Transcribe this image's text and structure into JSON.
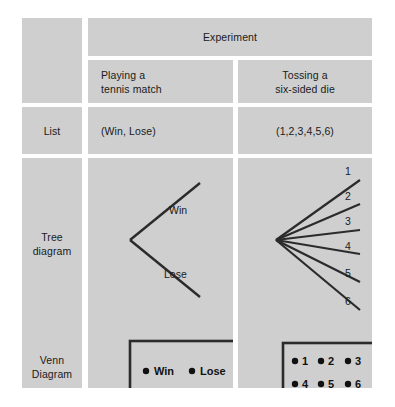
{
  "table": {
    "experiment_header": "Experiment",
    "columns": [
      {
        "id": "playing-tennis",
        "title_line1": "Playing a",
        "title_line2": "tennis match"
      },
      {
        "id": "tossing-die",
        "title_line1": "Tossing a",
        "title_line2": "six-sided die"
      }
    ],
    "row_labels": {
      "list": "List",
      "tree_line1": "Tree",
      "tree_line2": "diagram",
      "venn_line1": "Venn",
      "venn_line2": "Diagram"
    },
    "list_row": {
      "tennis": "(Win, Lose)",
      "die": "(1,2,3,4,5,6)"
    },
    "tree_row": {
      "tennis_branches": [
        "Win",
        "Lose"
      ],
      "die_branches": [
        "1",
        "2",
        "3",
        "4",
        "5",
        "6"
      ]
    },
    "venn_row": {
      "tennis_outcomes": [
        "Win",
        "Lose"
      ],
      "die_outcomes_row1": [
        "1",
        "2",
        "3"
      ],
      "die_outcomes_row2": [
        "4",
        "5",
        "6"
      ]
    }
  },
  "colors": {
    "page_background": "#ffffff",
    "cell_fill": "#cfcfcf",
    "ink": "#1a1a1a",
    "stroke": "#2b2b2b"
  }
}
